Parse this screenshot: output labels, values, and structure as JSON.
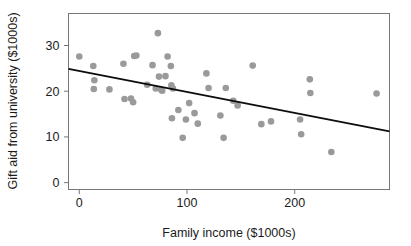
{
  "chart_data": {
    "type": "scatter",
    "title": "",
    "xlabel": "Family income ($1000s)",
    "ylabel": "Gift aid from university ($1000s)",
    "xlim": [
      -10,
      288
    ],
    "ylim": [
      -1.5,
      37
    ],
    "xticks": [
      0,
      100,
      200
    ],
    "xticklabels": [
      "0",
      "100",
      "200"
    ],
    "yticks": [
      0,
      10,
      20,
      30
    ],
    "yticklabels": [
      "0",
      "10",
      "20",
      "30"
    ],
    "grid": false,
    "legend": null,
    "marker": {
      "shape": "circle",
      "color": "#9a9a9a",
      "size_px": 5.4,
      "opacity": 1
    },
    "points": [
      {
        "x": 0.0,
        "y": 27.6
      },
      {
        "x": 13.0,
        "y": 25.5
      },
      {
        "x": 14.0,
        "y": 22.4
      },
      {
        "x": 13.5,
        "y": 20.5
      },
      {
        "x": 28.0,
        "y": 20.4
      },
      {
        "x": 41.0,
        "y": 26.0
      },
      {
        "x": 42.0,
        "y": 18.3
      },
      {
        "x": 48.0,
        "y": 18.4
      },
      {
        "x": 50.0,
        "y": 17.6
      },
      {
        "x": 51.0,
        "y": 27.7
      },
      {
        "x": 53.0,
        "y": 27.8
      },
      {
        "x": 63.0,
        "y": 21.4
      },
      {
        "x": 68.0,
        "y": 25.7
      },
      {
        "x": 71.0,
        "y": 20.6
      },
      {
        "x": 73.0,
        "y": 32.7
      },
      {
        "x": 74.0,
        "y": 23.2
      },
      {
        "x": 76.0,
        "y": 20.3
      },
      {
        "x": 77.0,
        "y": 20.1
      },
      {
        "x": 80.0,
        "y": 23.3
      },
      {
        "x": 82.0,
        "y": 27.6
      },
      {
        "x": 85.0,
        "y": 25.5
      },
      {
        "x": 85.5,
        "y": 21.3
      },
      {
        "x": 87.0,
        "y": 20.6
      },
      {
        "x": 86.0,
        "y": 14.1
      },
      {
        "x": 92.0,
        "y": 15.9
      },
      {
        "x": 96.0,
        "y": 9.8
      },
      {
        "x": 99.0,
        "y": 13.8
      },
      {
        "x": 102.0,
        "y": 17.4
      },
      {
        "x": 107.0,
        "y": 15.2
      },
      {
        "x": 110.0,
        "y": 12.9
      },
      {
        "x": 118.0,
        "y": 23.9
      },
      {
        "x": 120.0,
        "y": 20.7
      },
      {
        "x": 131.0,
        "y": 14.7
      },
      {
        "x": 134.0,
        "y": 9.8
      },
      {
        "x": 136.0,
        "y": 20.7
      },
      {
        "x": 143.0,
        "y": 17.9
      },
      {
        "x": 147.0,
        "y": 16.9
      },
      {
        "x": 161.0,
        "y": 25.6
      },
      {
        "x": 169.0,
        "y": 12.8
      },
      {
        "x": 178.0,
        "y": 13.4
      },
      {
        "x": 205.0,
        "y": 13.8
      },
      {
        "x": 206.0,
        "y": 10.6
      },
      {
        "x": 214.0,
        "y": 22.6
      },
      {
        "x": 214.5,
        "y": 19.6
      },
      {
        "x": 234.0,
        "y": 6.7
      },
      {
        "x": 276.0,
        "y": 19.5
      }
    ],
    "regression_line": {
      "name": "least-squares fit",
      "color": "#0d0d0d",
      "width_px": 1.8,
      "x_start": -10,
      "y_start": 24.9,
      "x_end": 288,
      "y_end": 11.2,
      "slope": -0.046,
      "intercept": 24.44
    }
  },
  "axes": {
    "frame_color": "#767676",
    "tick_color": "#767676",
    "background": "#ffffff"
  }
}
